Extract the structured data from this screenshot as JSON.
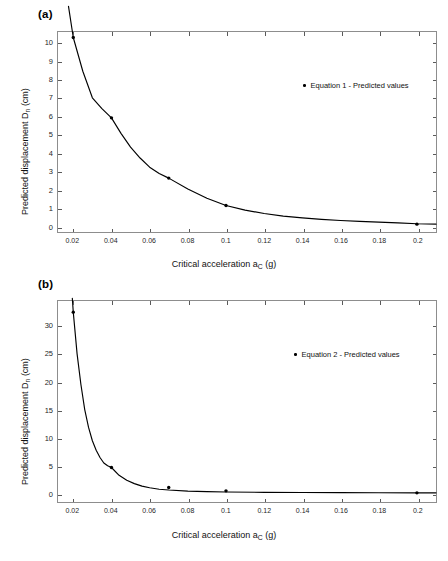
{
  "figure": {
    "background": "#ffffff",
    "line_color": "#000000",
    "marker_color": "#000000",
    "axis_color": "#8d8d8d"
  },
  "panels": [
    {
      "id": "a",
      "label": "(a)",
      "legend_label": "Equation 1 - Predicted values",
      "xlabel_prefix": "Critical acceleration a",
      "xlabel_sub": "C",
      "xlabel_suffix": " (g)",
      "ylabel_prefix": "Predicted displacement D",
      "ylabel_sub": "n",
      "ylabel_suffix": " (cm)",
      "xticklabels": [
        "0.02",
        "0.04",
        "0.06",
        "0.08",
        "0.1",
        "0.12",
        "0.14",
        "0.16",
        "0.18",
        "0.2"
      ],
      "yticklabels": [
        "0",
        "1",
        "2",
        "3",
        "4",
        "5",
        "6",
        "7",
        "8",
        "9",
        "10"
      ]
    },
    {
      "id": "b",
      "label": "(b)",
      "legend_label": "Equation 2 - Predicted values",
      "xlabel_prefix": "Critical acceleration a",
      "xlabel_sub": "C",
      "xlabel_suffix": " (g)",
      "ylabel_prefix": "Predicted displacement D",
      "ylabel_sub": "n",
      "ylabel_suffix": " (cm)",
      "xticklabels": [
        "0.02",
        "0.04",
        "0.06",
        "0.08",
        "0.1",
        "0.12",
        "0.14",
        "0.16",
        "0.18",
        "0.2"
      ],
      "yticklabels": [
        "0",
        "5",
        "10",
        "15",
        "20",
        "25",
        "30"
      ]
    }
  ],
  "chart_data": [
    {
      "type": "scatter",
      "panel": "a",
      "title": "(a)",
      "xlabel": "Critical acceleration a_C (g)",
      "ylabel": "Predicted displacement D_n (cm)",
      "xlim": [
        0.012,
        0.21
      ],
      "ylim": [
        -0.35,
        10.6
      ],
      "xticks": [
        0.02,
        0.04,
        0.06,
        0.08,
        0.1,
        0.12,
        0.14,
        0.16,
        0.18,
        0.2
      ],
      "yticks": [
        0,
        1,
        2,
        3,
        4,
        5,
        6,
        7,
        8,
        9,
        10
      ],
      "grid": false,
      "legend": [
        "Equation 1 - Predicted values"
      ],
      "legend_position": "upper right inside",
      "series": [
        {
          "name": "Equation 1 - Predicted values",
          "marker": "point",
          "x": [
            0.02,
            0.04,
            0.07,
            0.1,
            0.2
          ],
          "y": [
            10.3,
            5.9,
            2.6,
            1.1,
            0.08
          ]
        },
        {
          "name": "Equation 1 - fitted curve",
          "style": "line",
          "x": [
            0.0175,
            0.02,
            0.025,
            0.03,
            0.035,
            0.04,
            0.045,
            0.05,
            0.055,
            0.06,
            0.065,
            0.07,
            0.08,
            0.09,
            0.1,
            0.11,
            0.12,
            0.13,
            0.14,
            0.15,
            0.16,
            0.17,
            0.18,
            0.19,
            0.2,
            0.21
          ],
          "y": [
            12.0,
            10.3,
            8.45,
            7.0,
            6.4,
            5.9,
            5.05,
            4.3,
            3.7,
            3.2,
            2.85,
            2.6,
            2.0,
            1.5,
            1.1,
            0.85,
            0.66,
            0.52,
            0.42,
            0.34,
            0.28,
            0.23,
            0.19,
            0.15,
            0.1,
            0.08
          ]
        }
      ]
    },
    {
      "type": "scatter",
      "panel": "b",
      "title": "(b)",
      "xlabel": "Critical acceleration a_C (g)",
      "ylabel": "Predicted displacement D_n (cm)",
      "xlim": [
        0.012,
        0.21
      ],
      "ylim": [
        -1.6,
        34.5
      ],
      "xticks": [
        0.02,
        0.04,
        0.06,
        0.08,
        0.1,
        0.12,
        0.14,
        0.16,
        0.18,
        0.2
      ],
      "yticks": [
        0,
        5,
        10,
        15,
        20,
        25,
        30
      ],
      "grid": false,
      "legend": [
        "Equation 2 - Predicted values"
      ],
      "legend_position": "upper right inside",
      "series": [
        {
          "name": "Equation 2 - Predicted values",
          "marker": "point",
          "x": [
            0.02,
            0.04,
            0.07,
            0.1,
            0.2
          ],
          "y": [
            32.5,
            4.6,
            1.0,
            0.4,
            0.05
          ]
        },
        {
          "name": "Equation 2 - fitted curve",
          "style": "line",
          "x": [
            0.0195,
            0.02,
            0.022,
            0.024,
            0.026,
            0.028,
            0.03,
            0.032,
            0.034,
            0.036,
            0.038,
            0.04,
            0.044,
            0.048,
            0.052,
            0.056,
            0.06,
            0.065,
            0.07,
            0.08,
            0.09,
            0.1,
            0.12,
            0.14,
            0.16,
            0.18,
            0.2,
            0.21
          ],
          "y": [
            35.0,
            32.5,
            25.0,
            19.5,
            15.0,
            11.8,
            9.4,
            7.7,
            6.4,
            5.4,
            4.9,
            4.6,
            3.2,
            2.3,
            1.7,
            1.25,
            0.95,
            0.7,
            0.55,
            0.36,
            0.27,
            0.2,
            0.14,
            0.1,
            0.08,
            0.06,
            0.05,
            0.04
          ]
        }
      ]
    }
  ]
}
